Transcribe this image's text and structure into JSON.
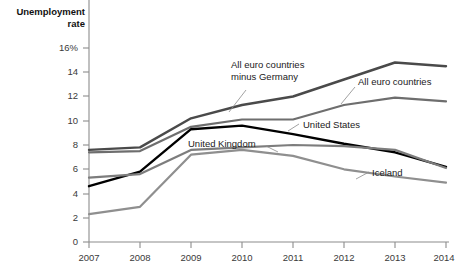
{
  "chart_data": {
    "type": "line",
    "title": "Unemployment rate",
    "ylabel": "Unemployment rate",
    "xlabel": "",
    "ylim": [
      0,
      16
    ],
    "xlim": [
      2007,
      2014
    ],
    "grid": false,
    "legend_position": "inline-annotations",
    "x": [
      2007,
      2008,
      2009,
      2010,
      2011,
      2012,
      2013,
      2014
    ],
    "x_tick_labels": [
      "2007",
      "2008",
      "2009",
      "2010",
      "2011",
      "2012",
      "2013",
      "2014"
    ],
    "y_tick_values": [
      0,
      2,
      4,
      6,
      8,
      10,
      12,
      14,
      16
    ],
    "y_tick_labels": [
      "0",
      "2",
      "4",
      "6",
      "8",
      "10",
      "12",
      "14",
      "16%"
    ],
    "series": [
      {
        "name": "All euro countries minus Germany",
        "color": "#4a4a4a",
        "width": 2.4,
        "values": [
          7.6,
          7.8,
          10.2,
          11.3,
          12.0,
          13.4,
          14.8,
          14.5
        ]
      },
      {
        "name": "All euro countries",
        "color": "#6e6e6e",
        "width": 2.2,
        "values": [
          7.4,
          7.5,
          9.5,
          10.1,
          10.1,
          11.3,
          11.9,
          11.6
        ]
      },
      {
        "name": "United States",
        "color": "#000000",
        "width": 2.4,
        "values": [
          4.6,
          5.8,
          9.3,
          9.6,
          8.9,
          8.1,
          7.4,
          6.2
        ]
      },
      {
        "name": "United Kingdom",
        "color": "#7d7d7d",
        "width": 2.2,
        "values": [
          5.3,
          5.6,
          7.6,
          7.8,
          8.0,
          7.9,
          7.6,
          6.1
        ]
      },
      {
        "name": "Iceland",
        "color": "#8f8f8f",
        "width": 2.2,
        "values": [
          2.3,
          2.9,
          7.2,
          7.6,
          7.1,
          6.0,
          5.4,
          4.9
        ]
      }
    ],
    "annotations": [
      {
        "label": "All euro countries minus Germany",
        "line1": "All euro countries",
        "line2": "minus Germany"
      },
      {
        "label": "All euro countries"
      },
      {
        "label": "United States"
      },
      {
        "label": "United Kingdom"
      },
      {
        "label": "Iceland"
      }
    ]
  },
  "axis": {
    "title_line1": "Unemployment",
    "title_line2": "rate"
  },
  "labels": {
    "euro_minus_germany_l1": "All euro countries",
    "euro_minus_germany_l2": "minus Germany",
    "all_euro": "All euro countries",
    "united_states": "United States",
    "united_kingdom": "United Kingdom",
    "iceland": "Iceland"
  },
  "ticks": {
    "y": [
      "16%",
      "14",
      "12",
      "10",
      "8",
      "6",
      "4",
      "2",
      "0"
    ],
    "x": [
      "2007",
      "2008",
      "2009",
      "2010",
      "2011",
      "2012",
      "2013",
      "2014"
    ]
  }
}
